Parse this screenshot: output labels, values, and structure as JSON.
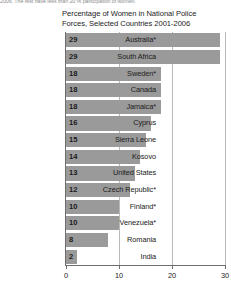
{
  "page": {
    "top_text_fragment": "2006. The rest have less than 20 % participation of women."
  },
  "chart_data": {
    "type": "bar",
    "orientation": "horizontal",
    "title": "Percentage of Women in National Police Forces, Selected Countries 2001-2006",
    "title_line1": "Percentage of Women in National Police",
    "title_line2": "Forces, Selected Countries 2001-2006",
    "xlabel": "",
    "ylabel": "",
    "xlim": [
      0,
      30
    ],
    "xticks": [
      0,
      10,
      20,
      30
    ],
    "xtick_labels": [
      "0",
      "10",
      "20",
      "30"
    ],
    "grid": true,
    "legend": false,
    "bar_color": "#9a9a9a",
    "axis_color": "#6e6e6e",
    "gridline_color": "#b9b9b9",
    "categories": [
      "Australia*",
      "South Africa",
      "Sweden*",
      "Canada",
      "Jamaica*",
      "Cyprus",
      "Sierra Leone",
      "Kosovo",
      "United States",
      "Czech Republic*",
      "Finland*",
      "Venezuela*",
      "Romania",
      "India"
    ],
    "values": [
      29,
      29,
      18,
      18,
      18,
      16,
      15,
      14,
      13,
      12,
      10,
      10,
      8,
      2
    ],
    "value_labels": [
      "29",
      "29",
      "18",
      "18",
      "18",
      "16",
      "15",
      "14",
      "13",
      "12",
      "10",
      "10",
      "8",
      "2"
    ]
  }
}
